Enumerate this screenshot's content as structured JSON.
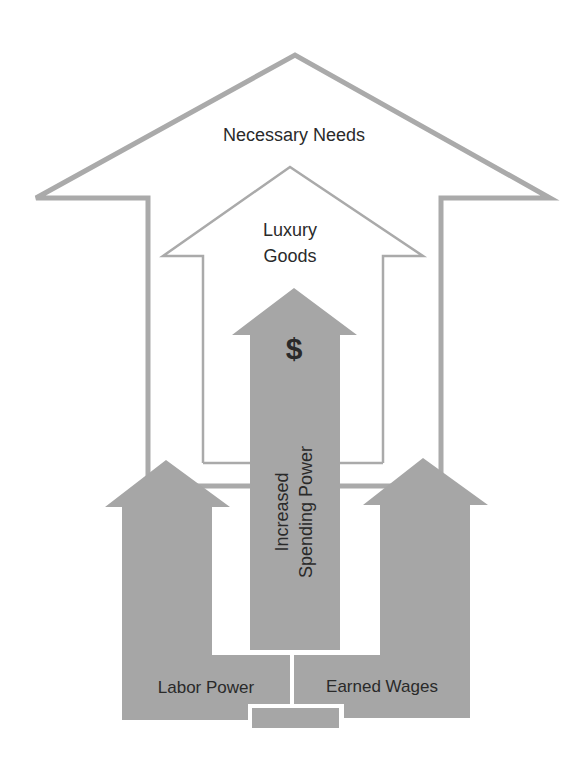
{
  "diagram": {
    "colors": {
      "outline": "#aaaaaa",
      "fill": "#a6a6a6",
      "text": "#2a2a2a",
      "background": "#ffffff"
    },
    "labels": {
      "outer_arrow": "Necessary Needs",
      "inner_arrow_line1": "Luxury",
      "inner_arrow_line2": "Goods",
      "center_symbol": "$",
      "center_line1": "Increased",
      "center_line2": "Spending Power",
      "left_base": "Labor Power",
      "right_base": "Earned Wages"
    },
    "icons": {
      "center_symbol": "dollar-sign-icon"
    }
  }
}
